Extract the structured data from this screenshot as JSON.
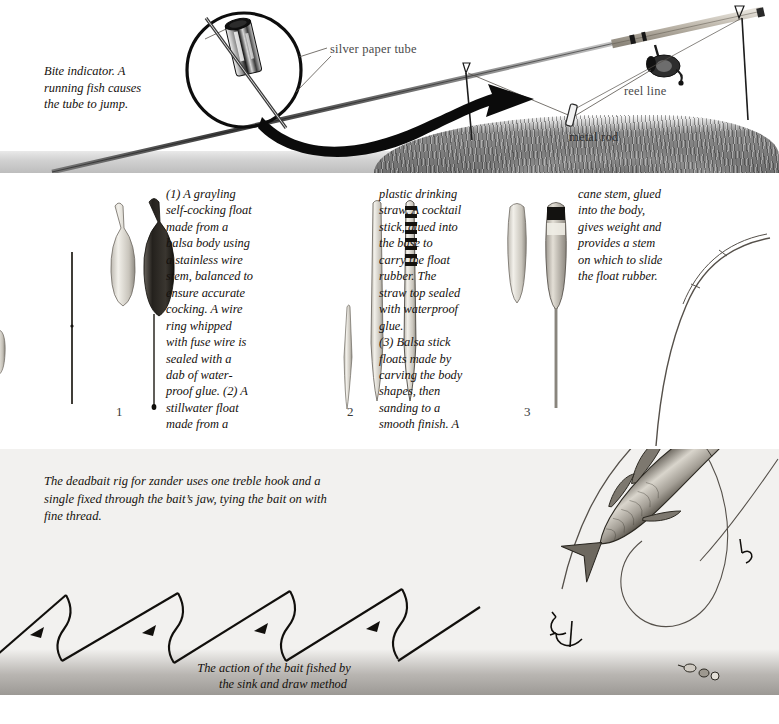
{
  "page": {
    "background": "#ffffff"
  },
  "panels": {
    "bite_indicator": {
      "name": "bite-indicator-panel",
      "caption": "Bite indicator. A running fish causes the tube to jump.",
      "caption_lines": [
        "Bite indicator. A",
        "running fish causes",
        "the tube to jump."
      ],
      "labels": {
        "silver_paper_tube": "silver paper tube",
        "reel_line": "reel line",
        "metal_rod": "metal rod"
      },
      "label_color": "#4a4a4a",
      "ground_color": "#bdbdbd",
      "grass_color": "#707070"
    },
    "floats": {
      "name": "float-construction-panel",
      "columns": [
        {
          "id": "col-1",
          "text": "(1) A grayling self-cocking float made from a balsa body using a stainless wire stem, balanced to ensure accurate cocking. A wire ring whipped with fuse wire is sealed with a dab of water-proof glue. (2) A stillwater float made from a",
          "lines": [
            "(1) A grayling",
            "self-cocking float",
            "made from a",
            "balsa body using",
            "a stainless wire",
            "stem, balanced to",
            "ensure accurate",
            "cocking. A wire",
            "ring whipped",
            "with fuse wire is",
            "sealed with a",
            "dab of water-",
            "proof glue. (2) A",
            "stillwater float",
            "made from a"
          ]
        },
        {
          "id": "col-2",
          "text": "plastic drinking straw. A cocktail stick, glued into the base to carry the float rubber. The straw top sealed with waterproof glue. (3) Balsa stick floats made by carving the body shapes, then sanding to a smooth finish. A",
          "lines": [
            "plastic drinking",
            "straw. A cocktail",
            "stick, glued into",
            "the base to",
            "carry the float",
            "rubber. The",
            "straw top sealed",
            "with waterproof",
            "glue.",
            "(3) Balsa stick",
            "floats made by",
            "carving the body",
            "shapes, then",
            "sanding to a",
            "smooth finish. A"
          ]
        },
        {
          "id": "col-3",
          "text": "cane stem, glued into the body, gives weight and provides a stem on which to slide the float rubber.",
          "lines": [
            "cane stem, glued",
            "into the body,",
            "gives weight and",
            "provides a stem",
            "on which to slide",
            "the float rubber."
          ]
        }
      ],
      "figure_numbers": [
        "1",
        "2",
        "3"
      ]
    },
    "deadbait_rig": {
      "name": "deadbait-rig-panel",
      "caption": "The deadbait rig for zander uses one treble hook and a single fixed through the bait's jaw, tying the bait on with fine thread.",
      "caption_lines": [
        "The deadbait rig for zander uses one treble hook and a",
        "single fixed through the bait’s jaw, tying the bait on with",
        "fine thread."
      ],
      "sink_draw_caption_lines": [
        "The action of the bait fished by",
        "the sink and draw method"
      ],
      "background": "#f2f1ef",
      "bed_color": "#9c9995"
    }
  }
}
